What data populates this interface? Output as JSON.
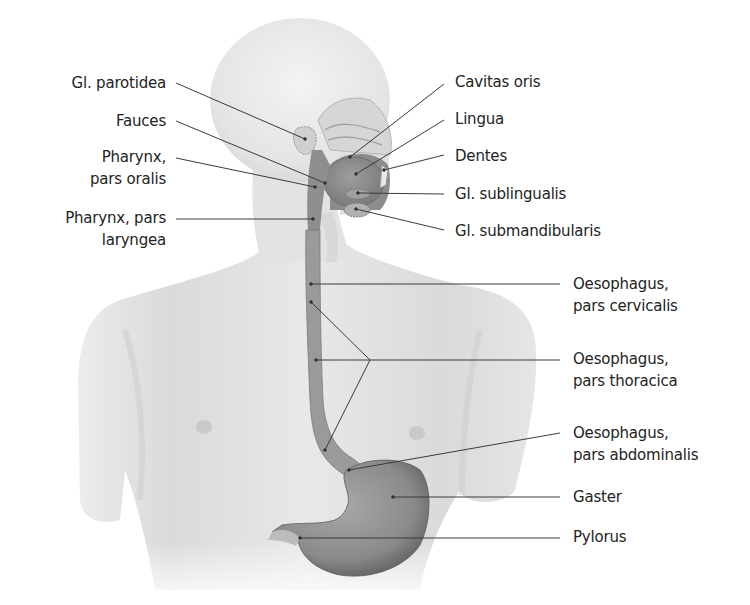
{
  "figure": {
    "colors": {
      "background": "#ffffff",
      "skin": "#e9e9e9",
      "skin_shadow": "#cfcfcf",
      "organ": "#8f8f8f",
      "organ_dark": "#6e6e6e",
      "leader_line": "#3a3a3a",
      "text": "#232323"
    }
  },
  "labels_left": [
    {
      "id": "gl-parotidea",
      "lines": [
        "Gl. parotidea"
      ],
      "x_right": 166,
      "y": 70,
      "line": [
        [
          176,
          83
        ],
        [
          305,
          139
        ]
      ]
    },
    {
      "id": "fauces",
      "lines": [
        "Fauces"
      ],
      "x_right": 166,
      "y": 108,
      "line": [
        [
          176,
          121
        ],
        [
          325,
          183
        ]
      ]
    },
    {
      "id": "pharynx-pars-oralis",
      "lines": [
        "Pharynx,",
        "pars oralis"
      ],
      "x_right": 166,
      "y": 145,
      "line": [
        [
          176,
          158
        ],
        [
          315,
          187
        ]
      ]
    },
    {
      "id": "pharynx-pars-laryngea",
      "lines": [
        "Pharynx, pars",
        "laryngea"
      ],
      "x_right": 166,
      "y": 206,
      "line": [
        [
          176,
          219
        ],
        [
          313,
          219
        ]
      ]
    }
  ],
  "labels_right": [
    {
      "id": "cavitas-oris",
      "lines": [
        "Cavitas oris"
      ],
      "x_left": 455,
      "y": 70,
      "line": [
        [
          444,
          84
        ],
        [
          350,
          157
        ]
      ]
    },
    {
      "id": "lingua",
      "lines": [
        "Lingua"
      ],
      "x_left": 455,
      "y": 107,
      "line": [
        [
          444,
          120
        ],
        [
          356,
          174
        ]
      ]
    },
    {
      "id": "dentes",
      "lines": [
        "Dentes"
      ],
      "x_left": 455,
      "y": 144,
      "line": [
        [
          444,
          155
        ],
        [
          384,
          170
        ]
      ]
    },
    {
      "id": "gl-sublingualis",
      "lines": [
        "Gl. sublingualis"
      ],
      "x_left": 455,
      "y": 182,
      "line": [
        [
          444,
          194
        ],
        [
          358,
          193
        ]
      ]
    },
    {
      "id": "gl-submandibularis",
      "lines": [
        "Gl. submandibularis"
      ],
      "x_left": 455,
      "y": 219,
      "line": [
        [
          444,
          230
        ],
        [
          356,
          209
        ]
      ]
    },
    {
      "id": "oesophagus-pars-cervicalis",
      "lines": [
        "Oesophagus,",
        "pars cervicalis"
      ],
      "x_left": 573,
      "y": 272,
      "line": [
        [
          560,
          284
        ],
        [
          311,
          284
        ]
      ]
    },
    {
      "id": "oesophagus-pars-thoracica",
      "lines": [
        "Oesophagus,",
        "pars thoracica"
      ],
      "x_left": 573,
      "y": 348,
      "line": [
        [
          560,
          360
        ],
        [
          316,
          360
        ]
      ],
      "extra_lines": [
        [
          [
            370,
            360
          ],
          [
            311,
            302
          ]
        ],
        [
          [
            370,
            360
          ],
          [
            325,
            450
          ]
        ]
      ]
    },
    {
      "id": "oesophagus-pars-abdominalis",
      "lines": [
        "Oesophagus,",
        "pars abdominalis"
      ],
      "x_left": 573,
      "y": 421,
      "line": [
        [
          560,
          433
        ],
        [
          349,
          470
        ]
      ]
    },
    {
      "id": "gaster",
      "lines": [
        "Gaster"
      ],
      "x_left": 573,
      "y": 485,
      "line": [
        [
          560,
          497
        ],
        [
          393,
          497
        ]
      ]
    },
    {
      "id": "pylorus",
      "lines": [
        "Pylorus"
      ],
      "x_left": 573,
      "y": 525,
      "line": [
        [
          560,
          538
        ],
        [
          300,
          538
        ]
      ]
    }
  ]
}
